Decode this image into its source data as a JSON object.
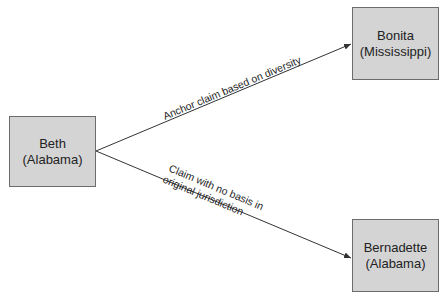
{
  "diagram": {
    "type": "directed-graph",
    "colors": {
      "node_fill": "#d4d4d4",
      "node_border": "#6c6c6c",
      "edge": "#333333",
      "text": "#222222",
      "background": "#ffffff"
    },
    "nodes": [
      {
        "id": "beth",
        "name": "Beth",
        "state": "(Alabama)"
      },
      {
        "id": "bonita",
        "name": "Bonita",
        "state": "(Mississippi)"
      },
      {
        "id": "bernadette",
        "name": "Bernadette",
        "state": "(Alabama)"
      }
    ],
    "edges": [
      {
        "from": "beth",
        "to": "bonita",
        "label_lines": [
          "Anchor claim based on diversity"
        ]
      },
      {
        "from": "beth",
        "to": "bernadette",
        "label_lines": [
          "Claim with no basis in",
          "original jurisdiction"
        ]
      }
    ]
  }
}
